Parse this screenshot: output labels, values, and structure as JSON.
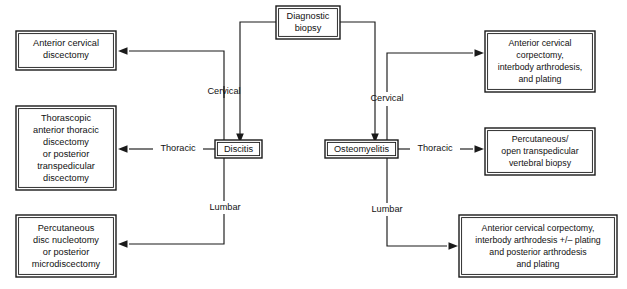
{
  "diagram": {
    "type": "flowchart",
    "colors": {
      "background": "#ffffff",
      "stroke": "#1a1a1a",
      "text": "#111111"
    },
    "nodes": {
      "root": {
        "name": "diagnostic-biopsy",
        "lines": [
          "Diagnostic",
          "biopsy"
        ]
      },
      "discitis": {
        "name": "discitis",
        "lines": [
          "Discitis"
        ]
      },
      "osteomyelitis": {
        "name": "osteomyelitis",
        "lines": [
          "Osteomyelitis"
        ]
      },
      "left_cervical": {
        "name": "anterior-cervical-discectomy",
        "lines": [
          "Anterior cervical",
          "discectomy"
        ]
      },
      "left_thoracic": {
        "name": "thorascopic-anterior-thoracic-discectomy",
        "lines": [
          "Thorascopic",
          "anterior thoracic",
          "discectomy",
          "or posterior",
          "transpedicular",
          "discectomy"
        ]
      },
      "left_lumbar": {
        "name": "percutaneous-disc-nucleotomy",
        "lines": [
          "Percutaneous",
          "disc nucleotomy",
          "or posterior",
          "microdiscectomy"
        ]
      },
      "right_cervical": {
        "name": "anterior-cervical-corpectomy-interbody-arthrodesis-plating",
        "lines": [
          "Anterior cervical",
          "corpectomy,",
          "interbody arthrodesis,",
          "and plating"
        ]
      },
      "right_thoracic": {
        "name": "percutaneous-open-transpedicular-vertebral-biopsy",
        "lines": [
          "Percutaneous/",
          "open transpedicular",
          "vertebral biopsy"
        ]
      },
      "right_lumbar": {
        "name": "anterior-cervical-corpectomy-posterior-arthrodesis-plating",
        "lines": [
          "Anterior cervical corpectomy,",
          "interbody arthrodesis +/– plating",
          "and posterior arthrodesis",
          "and plating"
        ]
      }
    },
    "edge_labels": {
      "left_cervical": "Cervical",
      "left_thoracic": "Thoracic",
      "left_lumbar": "Lumbar",
      "right_cervical": "Cervical",
      "right_thoracic": "Thoracic",
      "right_lumbar": "Lumbar"
    }
  }
}
